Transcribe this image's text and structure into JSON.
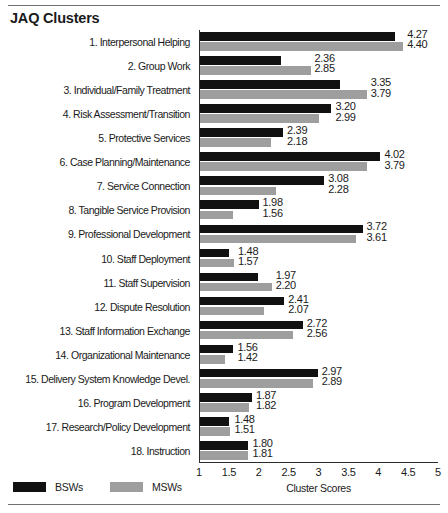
{
  "header": {
    "title": "JAQ Clusters"
  },
  "legend": {
    "items": [
      {
        "label": "BSWs",
        "color": "#111111",
        "key": "bsw"
      },
      {
        "label": "MSWs",
        "color": "#9e9e9e",
        "key": "msw"
      }
    ]
  },
  "axis": {
    "xlabel": "Cluster Scores",
    "ticks": [
      "1",
      "1.5",
      "2",
      "2.5",
      "3",
      "3.5",
      "4",
      "4.5",
      "5"
    ]
  },
  "chart_data": {
    "type": "bar",
    "orientation": "horizontal",
    "title": "JAQ Clusters",
    "xlabel": "Cluster Scores",
    "ylabel": "",
    "xlim": [
      1,
      5
    ],
    "xticks": [
      1,
      1.5,
      2,
      2.5,
      3,
      3.5,
      4,
      4.5,
      5
    ],
    "grid": false,
    "legend_position": "bottom-left",
    "categories": [
      "1.  Interpersonal Helping",
      "2.  Group Work",
      "3. Individual/Family Treatment",
      "4.  Risk Assessment/Transition",
      "5.   Protective Services",
      "6.  Case Planning/Maintenance",
      "7.  Service Connection",
      "8.  Tangible Service Provision",
      "9.  Professional Development",
      "10.  Staff Deployment",
      "11.  Staff Supervision",
      "12.  Dispute Resolution",
      "13.  Staff Information Exchange",
      "14.  Organizational Maintenance",
      "15. Delivery System Knowledge Devel.",
      "16.  Program Development",
      "17.  Research/Policy Development",
      "18.    Instruction"
    ],
    "series": [
      {
        "name": "BSWs",
        "color": "#111111",
        "values": [
          4.27,
          2.36,
          3.35,
          3.2,
          2.39,
          4.02,
          3.08,
          1.98,
          3.72,
          1.48,
          1.97,
          2.41,
          2.72,
          1.56,
          2.97,
          1.87,
          1.48,
          1.8
        ]
      },
      {
        "name": "MSWs",
        "color": "#9e9e9e",
        "values": [
          4.4,
          2.85,
          3.79,
          2.99,
          2.18,
          3.79,
          2.28,
          1.56,
          3.61,
          1.57,
          2.2,
          2.07,
          2.56,
          1.42,
          2.89,
          1.82,
          1.51,
          1.81
        ]
      }
    ],
    "value_labels": {
      "bsw": [
        "4.27",
        "2.36",
        "3.35",
        "3.20",
        "2.39",
        "4.02",
        "3.08",
        "1.98",
        "3.72",
        "1.48",
        "1.97",
        "2.41",
        "2.72",
        "1.56",
        "2.97",
        "1.87",
        "1.48",
        "1.80"
      ],
      "msw": [
        "4.40",
        "2.85",
        "3.79",
        "2.99",
        "2.18",
        "3.79",
        "2.28",
        "1.56",
        "3.61",
        "1.57",
        "2.20",
        "2.07",
        "2.56",
        "1.42",
        "2.89",
        "1.82",
        "1.51",
        "1.81"
      ]
    }
  }
}
